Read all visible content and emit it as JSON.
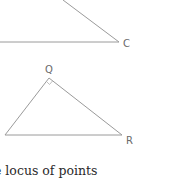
{
  "diagram": {
    "triangle_top": {
      "label_c": "C",
      "points": {
        "apex_top": [
          63,
          0
        ],
        "c": [
          119,
          42
        ],
        "left": [
          0,
          42
        ]
      }
    },
    "triangle_pqr": {
      "label_q": "Q",
      "label_r": "R",
      "label_p_partial": "",
      "right_angle_at": "Q",
      "points": {
        "p": [
          5,
          135
        ],
        "q": [
          49,
          78
        ],
        "r": [
          122,
          135
        ]
      }
    },
    "colors": {
      "line": "#9a9a9a",
      "label": "#6a6a6a",
      "text": "#2a2a2a"
    }
  },
  "text": {
    "caption_partial": "e locus of points"
  }
}
